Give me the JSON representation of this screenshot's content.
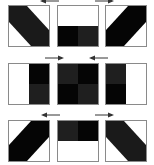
{
  "colors": {
    "black": "#050505",
    "dark": "#1c1c1c",
    "white": "#ffffff",
    "border": "#8a8a8a"
  },
  "tiles": [
    {
      "name": "tile-r1c1",
      "pattern": "diagonal-band-down",
      "x": 8,
      "y": 5
    },
    {
      "name": "tile-r1c2",
      "pattern": "white-top-black-dark-bottom",
      "x": 57,
      "y": 5
    },
    {
      "name": "tile-r1c3",
      "pattern": "diagonal-band-up",
      "x": 105,
      "y": 5
    },
    {
      "name": "tile-r2c1",
      "pattern": "white-left-black-dark-right",
      "x": 8,
      "y": 63
    },
    {
      "name": "tile-r2c2",
      "pattern": "checker-dark-black",
      "x": 57,
      "y": 63
    },
    {
      "name": "tile-r2c3",
      "pattern": "dark-black-left-white-right",
      "x": 105,
      "y": 63
    },
    {
      "name": "tile-r3c1",
      "pattern": "diagonal-band-up",
      "x": 8,
      "y": 120
    },
    {
      "name": "tile-r3c2",
      "pattern": "dark-black-top-white-bottom",
      "x": 57,
      "y": 120
    },
    {
      "name": "tile-r3c3",
      "pattern": "diagonal-band-down",
      "x": 105,
      "y": 120
    }
  ],
  "arrows": [
    {
      "name": "arrow-left-r1",
      "direction": "left",
      "x": 40,
      "y": 0
    },
    {
      "name": "arrow-right-r1",
      "direction": "right",
      "x": 95,
      "y": 0
    },
    {
      "name": "arrow-right-r2",
      "direction": "right",
      "x": 45,
      "y": 56
    },
    {
      "name": "arrow-left-r2",
      "direction": "left",
      "x": 90,
      "y": 56
    },
    {
      "name": "arrow-left-r3",
      "direction": "left",
      "x": 42,
      "y": 113
    },
    {
      "name": "arrow-right-r3",
      "direction": "right",
      "x": 95,
      "y": 113
    }
  ]
}
